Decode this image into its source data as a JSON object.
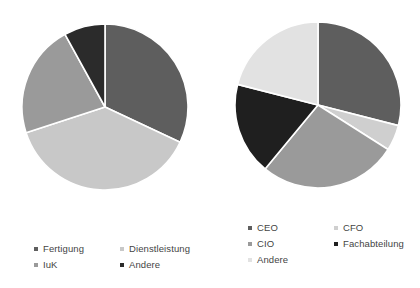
{
  "chart_data": [
    {
      "type": "pie",
      "title": "",
      "chart_id": "branche",
      "legend_position": "bottom",
      "legend_columns": 2,
      "start_angle_deg": 0,
      "direction": "clockwise",
      "categories": [
        "Fertigung",
        "Dienstleistung",
        "IuK",
        "Andere"
      ],
      "values": [
        32,
        38,
        22,
        8
      ],
      "colors": [
        "#5e5e5e",
        "#c8c8c8",
        "#9a9a9a",
        "#2b2b2b"
      ],
      "slices": [
        {
          "label": "Fertigung",
          "value": 32,
          "color": "#5e5e5e"
        },
        {
          "label": "Dienstleistung",
          "value": 38,
          "color": "#c8c8c8"
        },
        {
          "label": "IuK",
          "value": 22,
          "color": "#9a9a9a"
        },
        {
          "label": "Andere",
          "value": 8,
          "color": "#2b2b2b"
        }
      ]
    },
    {
      "type": "pie",
      "title": "",
      "chart_id": "funktion",
      "legend_position": "bottom",
      "legend_columns": 2,
      "start_angle_deg": 0,
      "direction": "clockwise",
      "categories": [
        "CEO",
        "CFO",
        "CIO",
        "Fachabteilung",
        "Andere"
      ],
      "values": [
        29,
        5,
        27,
        18,
        21
      ],
      "colors": [
        "#5e5e5e",
        "#cfcfcf",
        "#9a9a9a",
        "#1f1f1f",
        "#e2e2e2"
      ],
      "slices": [
        {
          "label": "CEO",
          "value": 29,
          "color": "#5e5e5e"
        },
        {
          "label": "CFO",
          "value": 5,
          "color": "#cfcfcf"
        },
        {
          "label": "CIO",
          "value": 27,
          "color": "#9a9a9a"
        },
        {
          "label": "Fachabteilung",
          "value": 18,
          "color": "#1f1f1f"
        },
        {
          "label": "Andere",
          "value": 21,
          "color": "#e2e2e2"
        }
      ]
    }
  ],
  "left_chart": {
    "legend": {
      "items": [
        {
          "label": "Fertigung",
          "color": "#5e5e5e"
        },
        {
          "label": "Dienstleistung",
          "color": "#c8c8c8"
        },
        {
          "label": "IuK",
          "color": "#9a9a9a"
        },
        {
          "label": "Andere",
          "color": "#2b2b2b"
        }
      ]
    }
  },
  "right_chart": {
    "legend": {
      "items": [
        {
          "label": "CEO",
          "color": "#5e5e5e"
        },
        {
          "label": "CFO",
          "color": "#cfcfcf"
        },
        {
          "label": "CIO",
          "color": "#9a9a9a"
        },
        {
          "label": "Fachabteilung",
          "color": "#1f1f1f"
        },
        {
          "label": "Andere",
          "color": "#e2e2e2"
        }
      ]
    }
  },
  "footer": {
    "text": ""
  }
}
